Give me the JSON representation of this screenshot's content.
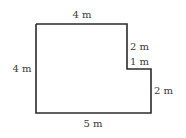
{
  "diagram": {
    "type": "floor-plan-shape",
    "stroke_color": "#2b2b2b",
    "label_color": "#3a3a3a",
    "labels": {
      "top": "4 m",
      "left": "4 m",
      "bottom": "5 m",
      "right_upper": "2 m",
      "step": "1 m",
      "right_lower": "2 m"
    }
  }
}
